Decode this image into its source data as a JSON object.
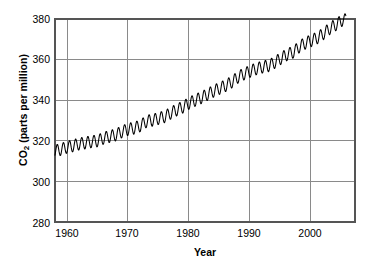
{
  "title": "",
  "axes": {
    "ylabel_main": "CO",
    "ylabel_sub": "2",
    "ylabel_rest": " (parts per million)",
    "xlabel": "Year"
  },
  "chart_data": {
    "type": "line",
    "title": "",
    "xlabel": "Year",
    "ylabel": "CO2 (parts per million)",
    "xlim": [
      1958,
      2007
    ],
    "ylim": [
      280,
      380
    ],
    "xticks": [
      1960,
      1970,
      1980,
      1990,
      2000
    ],
    "yticks": [
      280,
      300,
      320,
      340,
      360,
      380
    ],
    "grid": true,
    "legend": "none",
    "series": [
      {
        "name": "Atmospheric CO2 (Mauna Loa)",
        "color": "#000000",
        "description": "Monthly mean CO2 with seasonal sawtooth oscillation of about 6 ppm peak-to-peak superimposed on a rising trend",
        "seasonal_amplitude_ppm": 3.0,
        "x": [
          1958,
          1959,
          1960,
          1961,
          1962,
          1963,
          1964,
          1965,
          1966,
          1967,
          1968,
          1969,
          1970,
          1971,
          1972,
          1973,
          1974,
          1975,
          1976,
          1977,
          1978,
          1979,
          1980,
          1981,
          1982,
          1983,
          1984,
          1985,
          1986,
          1987,
          1988,
          1989,
          1990,
          1991,
          1992,
          1993,
          1994,
          1995,
          1996,
          1997,
          1998,
          1999,
          2000,
          2001,
          2002,
          2003,
          2004,
          2005
        ],
        "annual_mean": [
          315.0,
          315.8,
          316.9,
          317.6,
          318.5,
          319.0,
          319.6,
          320.0,
          321.4,
          322.2,
          323.0,
          324.6,
          325.7,
          326.3,
          327.5,
          329.7,
          330.2,
          331.1,
          332.0,
          333.8,
          335.4,
          336.8,
          338.7,
          340.1,
          341.4,
          343.0,
          344.6,
          346.0,
          347.4,
          349.2,
          351.6,
          353.1,
          354.4,
          355.6,
          356.4,
          357.1,
          358.8,
          360.8,
          362.6,
          363.8,
          366.6,
          368.3,
          369.5,
          371.0,
          373.1,
          375.6,
          377.4,
          379.6
        ]
      }
    ]
  },
  "ticks": {
    "y": [
      "380",
      "360",
      "340",
      "320",
      "300",
      "280"
    ],
    "x": [
      "1960",
      "1970",
      "1980",
      "1990",
      "2000"
    ]
  },
  "colors": {
    "line": "#000000",
    "grid": "#888888",
    "frame": "#4d4d4d",
    "text": "#000000",
    "background": "#ffffff"
  }
}
